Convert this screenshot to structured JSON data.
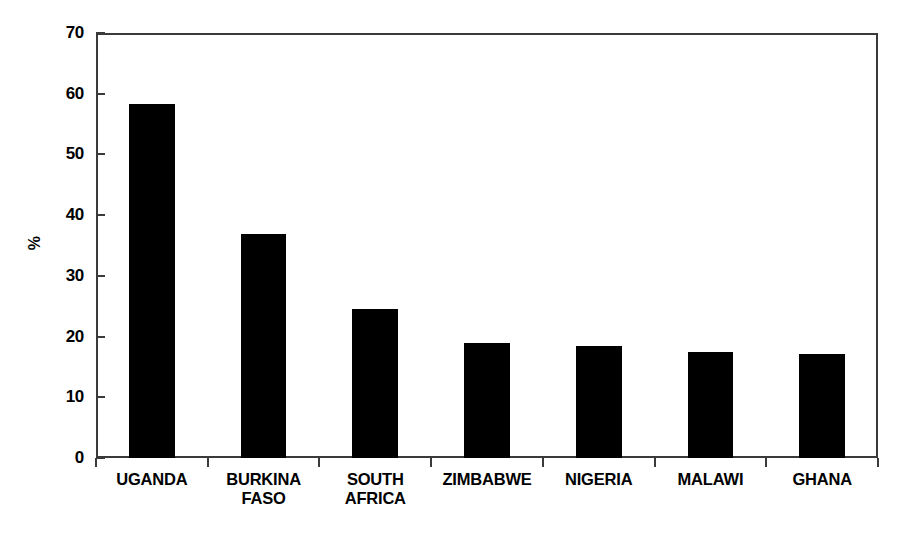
{
  "chart_data": {
    "type": "bar",
    "title": "",
    "subtitle": "",
    "xlabel": "",
    "ylabel": "%",
    "ylim": [
      0,
      70
    ],
    "yticks": [
      0,
      10,
      20,
      30,
      40,
      50,
      60,
      70
    ],
    "ytick_labels": [
      "0",
      "10",
      "20",
      "30",
      "40",
      "50",
      "60",
      "70"
    ],
    "grid": false,
    "legend": null,
    "bar_color": "#000000",
    "frame_color": "#3a3a3a",
    "categories": [
      "UGANDA",
      "BURKINA FASO",
      "SOUTH AFRICA",
      "ZIMBABWE",
      "NIGERIA",
      "MALAWI",
      "GHANA"
    ],
    "category_label_lines": [
      [
        "UGANDA"
      ],
      [
        "BURKINA",
        "FASO"
      ],
      [
        "SOUTH",
        "AFRICA"
      ],
      [
        "ZIMBABWE"
      ],
      [
        "NIGERIA"
      ],
      [
        "MALAWI"
      ],
      [
        "GHANA"
      ]
    ],
    "values": [
      58.3,
      36.9,
      24.6,
      18.9,
      18.5,
      17.4,
      17.2
    ]
  },
  "caption": {
    "cut_off_text": ""
  }
}
